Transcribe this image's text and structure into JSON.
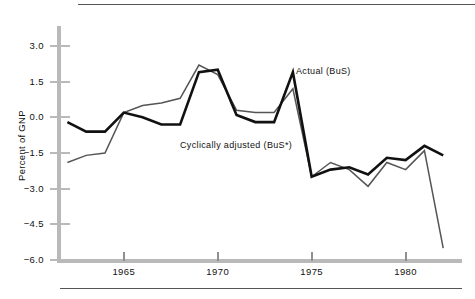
{
  "figure": {
    "background": "#ffffff",
    "axis_color": "#b9b9b9",
    "rule_color": "#555555"
  },
  "annotations": {
    "actual_label": "Actual (BuS)",
    "adjusted_label": "Cyclically adjusted (BuS*)"
  },
  "chart_data": {
    "type": "line",
    "title": "",
    "subtitle": "",
    "xlabel": "",
    "ylabel": "Percent of GNP",
    "xlim": [
      1961.5,
      1983.0
    ],
    "ylim": [
      -6.0,
      3.9
    ],
    "grid": false,
    "legend": "annotated-inline",
    "yticks": [
      3.0,
      1.5,
      0.0,
      -1.5,
      -3.0,
      -4.5,
      -6.0
    ],
    "ytick_labels": [
      "3.0",
      "1.5",
      "0.0",
      "-1.5",
      "-3.0",
      "-4.5",
      "-6.0"
    ],
    "xticks": [
      1965,
      1970,
      1975,
      1980
    ],
    "xtick_labels": [
      "1965",
      "1970",
      "1975",
      "1980"
    ],
    "x": [
      1962,
      1963,
      1964,
      1965,
      1966,
      1967,
      1968,
      1969,
      1970,
      1971,
      1972,
      1973,
      1974,
      1975,
      1976,
      1977,
      1978,
      1979,
      1980,
      1981,
      1982
    ],
    "series": [
      {
        "name": "Actual (BuS)",
        "color": "#111111",
        "width": 2.6,
        "values": [
          -0.2,
          -0.6,
          -0.6,
          0.2,
          0.0,
          -0.3,
          -0.3,
          1.9,
          2.0,
          0.1,
          -0.2,
          -0.2,
          1.9,
          -2.5,
          -2.2,
          -2.1,
          -2.4,
          -1.7,
          -1.8,
          -1.2,
          -1.6
        ]
      },
      {
        "name": "Cyclically adjusted (BuS*)",
        "color": "#555555",
        "width": 1.5,
        "values": [
          -1.9,
          -1.6,
          -1.5,
          0.2,
          0.5,
          0.6,
          0.8,
          2.2,
          1.8,
          0.3,
          0.2,
          0.2,
          1.2,
          -2.5,
          -1.9,
          -2.2,
          -2.9,
          -1.9,
          -2.2,
          -1.4,
          -5.5
        ]
      }
    ]
  }
}
